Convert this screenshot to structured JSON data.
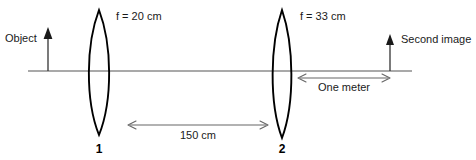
{
  "diagram": {
    "background_color": "#ffffff",
    "ink_color": "#1a1a1a",
    "axis_color": "#555555",
    "dimension_color": "#666666"
  },
  "labels": {
    "object": "Object",
    "second_image": "Second image",
    "focal_length_lens1": "f = 20 cm",
    "focal_length_lens2": "f = 33 cm",
    "lens1_number": "1",
    "lens2_number": "2",
    "separation_lenses": "150 cm",
    "distance_lens2_to_image": "One meter"
  },
  "elements": {
    "optical_axis": {
      "name": "optical-axis",
      "y": 71,
      "x_start": 28,
      "x_end": 412
    },
    "object_arrow": {
      "name": "object-arrow",
      "x": 48,
      "base_y": 71,
      "tip_y": 28,
      "direction": "up"
    },
    "second_image_arrow": {
      "name": "second-image-arrow",
      "x": 390,
      "base_y": 71,
      "tip_y": 35,
      "direction": "up"
    },
    "lens1": {
      "name": "converging-lens-1",
      "center_x": 99,
      "top_y": 10,
      "bottom_y": 135,
      "half_width": 14,
      "type": "biconvex"
    },
    "lens2": {
      "name": "converging-lens-2",
      "center_x": 282,
      "top_y": 10,
      "bottom_y": 138,
      "half_width": 13,
      "type": "biconvex"
    },
    "dim_150cm": {
      "name": "dimension-150cm",
      "y": 125,
      "x_start": 128,
      "x_end": 268
    },
    "dim_one_meter": {
      "name": "dimension-one-meter",
      "y": 78,
      "x_start": 298,
      "x_end": 390
    }
  }
}
